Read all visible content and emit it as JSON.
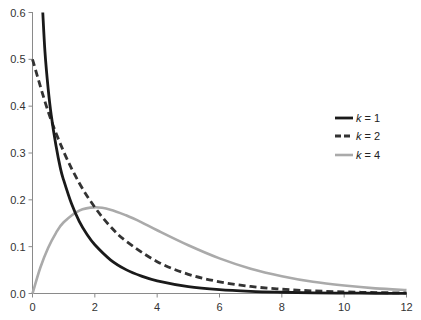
{
  "chart_data": {
    "type": "line",
    "title": "",
    "xlabel": "",
    "ylabel": "",
    "xlim": [
      0,
      12
    ],
    "ylim": [
      0,
      0.6
    ],
    "grid": false,
    "legend_position": "right-center",
    "x_ticks": [
      "0",
      "2",
      "4",
      "6",
      "8",
      "10",
      "12"
    ],
    "y_ticks": [
      "0.0",
      "0.1",
      "0.2",
      "0.3",
      "0.4",
      "0.5",
      "0.6"
    ],
    "series": [
      {
        "name": "k = 1",
        "italic_var": "k",
        "value_text": "= 1",
        "color": "#1a1a1a",
        "style": "solid",
        "x": [
          0.33,
          0.4,
          0.5,
          0.6,
          0.75,
          0.9,
          1.0,
          1.25,
          1.5,
          1.75,
          2.0,
          2.5,
          3.0,
          3.5,
          4.0,
          5.0,
          6.0,
          7.0,
          8.0,
          9.0,
          10.0,
          11.0,
          12.0
        ],
        "y": [
          0.6,
          0.516,
          0.439,
          0.381,
          0.317,
          0.266,
          0.242,
          0.192,
          0.154,
          0.126,
          0.104,
          0.072,
          0.051,
          0.037,
          0.027,
          0.0146,
          0.0081,
          0.0046,
          0.0027,
          0.0015,
          0.0009,
          0.0005,
          0.0003
        ]
      },
      {
        "name": "k = 2",
        "italic_var": "k",
        "value_text": "= 2",
        "color": "#333333",
        "style": "dashed",
        "x": [
          0,
          0.5,
          1,
          1.5,
          2,
          2.5,
          3,
          4,
          5,
          6,
          7,
          8,
          9,
          10,
          11,
          12
        ],
        "y": [
          0.5,
          0.389,
          0.303,
          0.236,
          0.184,
          0.143,
          0.112,
          0.068,
          0.041,
          0.025,
          0.015,
          0.0092,
          0.0056,
          0.0034,
          0.002,
          0.0012
        ]
      },
      {
        "name": "k = 4",
        "italic_var": "k",
        "value_text": "= 4",
        "color": "#aaaaaa",
        "style": "solid",
        "x": [
          0,
          0.25,
          0.5,
          0.75,
          1,
          1.5,
          2,
          2.5,
          3,
          3.5,
          4,
          5,
          6,
          7,
          8,
          9,
          10,
          11,
          12
        ],
        "y": [
          0,
          0.055,
          0.097,
          0.129,
          0.152,
          0.177,
          0.184,
          0.179,
          0.167,
          0.152,
          0.135,
          0.103,
          0.075,
          0.053,
          0.037,
          0.025,
          0.017,
          0.011,
          0.0074
        ]
      }
    ]
  }
}
